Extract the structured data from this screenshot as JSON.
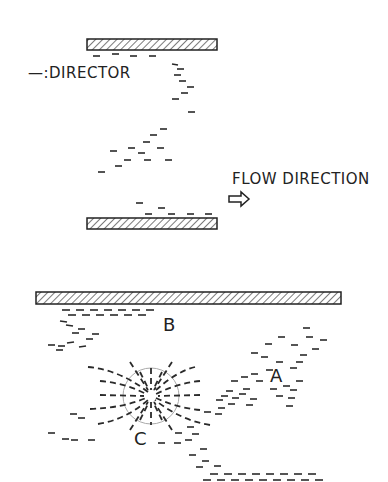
{
  "labels": {
    "legend_symbol": "—",
    "legend_text": ":DIRECTOR",
    "flow": "FLOW DIRECTION",
    "A": "A",
    "B": "B",
    "C": "C"
  },
  "colors": {
    "ink": "#2a2a2a",
    "circle": "#aaaaaa",
    "background": "#ffffff"
  }
}
